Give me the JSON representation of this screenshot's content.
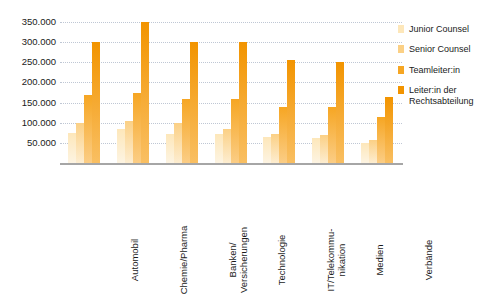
{
  "chart_data": {
    "type": "bar",
    "title": "",
    "subtitle": "",
    "xlabel": "",
    "ylabel": "",
    "ylim": [
      0,
      350000
    ],
    "ytick_step": 50000,
    "ytick_labels": [
      "350.000",
      "300.000",
      "250.000",
      "200.000",
      "150.000",
      "100.000",
      "50.000"
    ],
    "ytick_values": [
      350000,
      300000,
      250000,
      200000,
      150000,
      100000,
      50000
    ],
    "grid": true,
    "grid_axis": "y",
    "legend_position": "right",
    "categories": [
      "Automobil",
      "Chemie/Pharma",
      "Banken/\nVersicherungen",
      "Technologie",
      "IT/Telekommu-\nnikation",
      "Medien",
      "Verbände"
    ],
    "series": [
      {
        "name": "Junior Counsel",
        "color": "#fde7ba",
        "values": [
          75000,
          85000,
          72000,
          72000,
          65000,
          62000,
          50000
        ]
      },
      {
        "name": "Senior Counsel",
        "color": "#fbd085",
        "values": [
          100000,
          105000,
          100000,
          85000,
          73000,
          70000,
          58000
        ]
      },
      {
        "name": "Teamleiter:in",
        "color": "#f6a623",
        "values": [
          170000,
          175000,
          158000,
          160000,
          140000,
          138000,
          115000
        ]
      },
      {
        "name": "Leiter:in der\nRechtsabteilung",
        "color": "#f29400",
        "values": [
          300000,
          350000,
          300000,
          300000,
          255000,
          250000,
          165000
        ]
      }
    ]
  },
  "legend": {
    "items": [
      {
        "label": "Junior Counsel",
        "color": "#fde7ba"
      },
      {
        "label": "Senior Counsel",
        "color": "#fbd085"
      },
      {
        "label": "Teamleiter:in",
        "color": "#f6a623"
      },
      {
        "label": "Leiter:in der\nRechtsabteilung",
        "color": "#f29400"
      }
    ]
  }
}
